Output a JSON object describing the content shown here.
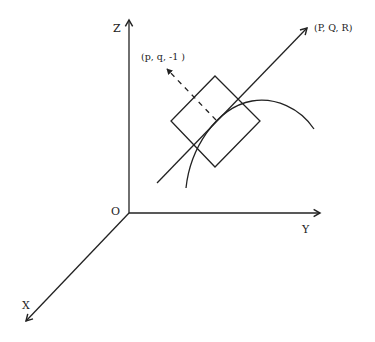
{
  "diagram": {
    "axes": {
      "x_label": "X",
      "y_label": "Y",
      "z_label": "Z",
      "origin_label": "O"
    },
    "points": {
      "line_end_label": "(P, Q, R)",
      "normal_label": "(p, q, -1 )"
    },
    "colors": {
      "ink": "#222222",
      "background": "#ffffff"
    }
  }
}
